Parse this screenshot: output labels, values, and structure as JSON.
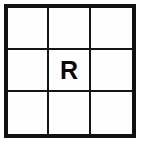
{
  "figure": {
    "type": "grid",
    "name": "3x3-grid-with-letter",
    "rows": 3,
    "columns": 3,
    "background_color": "#ffffff",
    "cell_background_color": "#fefefe",
    "outer_border_color": "#111111",
    "inner_line_color": "#141414",
    "label_color": "#0a0a0a"
  },
  "cells": [
    {
      "id": "cell-r1c1",
      "row": 1,
      "column": 1,
      "label": ""
    },
    {
      "id": "cell-r1c2",
      "row": 1,
      "column": 2,
      "label": ""
    },
    {
      "id": "cell-r1c3",
      "row": 1,
      "column": 3,
      "label": ""
    },
    {
      "id": "cell-r2c1",
      "row": 2,
      "column": 1,
      "label": ""
    },
    {
      "id": "cell-r2c2",
      "row": 2,
      "column": 2,
      "label": "R"
    },
    {
      "id": "cell-r2c3",
      "row": 2,
      "column": 3,
      "label": ""
    },
    {
      "id": "cell-r3c1",
      "row": 3,
      "column": 1,
      "label": ""
    },
    {
      "id": "cell-r3c2",
      "row": 3,
      "column": 2,
      "label": ""
    },
    {
      "id": "cell-r3c3",
      "row": 3,
      "column": 3,
      "label": ""
    }
  ]
}
